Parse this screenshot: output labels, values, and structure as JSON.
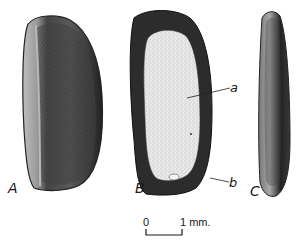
{
  "figure": {
    "views": [
      {
        "id": "A",
        "label": "A",
        "description": "seed external view"
      },
      {
        "id": "B",
        "label": "B",
        "description": "seed longitudinal section"
      },
      {
        "id": "C",
        "label": "C",
        "description": "seed side view"
      }
    ],
    "annotations": [
      {
        "label": "a",
        "target": "endosperm"
      },
      {
        "label": "b",
        "target": "embryo"
      }
    ],
    "scale_bar": {
      "start_label": "0",
      "end_label": "1 mm."
    },
    "colors": {
      "ink": "#1a1a1a",
      "dark_fill": "#2e2e2e",
      "mid_fill": "#555555",
      "light_fill": "#e6e6e6",
      "background": "#ffffff"
    }
  }
}
